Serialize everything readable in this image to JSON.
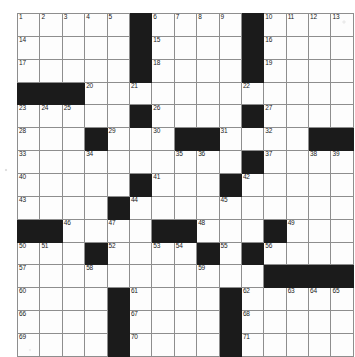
{
  "document": {
    "type": "crossword-puzzle",
    "title": "Crossword Puzzle Grid",
    "grid_size": {
      "rows": 15,
      "cols": 15
    },
    "colors": {
      "block": "#1b1b1b",
      "cell": "#fdfdfd",
      "grid_line": "#8e8e8e",
      "outer_border": "#4a4a4a",
      "number_text": "#1a1a1a"
    },
    "highest_clue_number": 71,
    "grid": [
      [
        {
          "n": "1"
        },
        {
          "n": "2"
        },
        {
          "n": "3"
        },
        {
          "n": "4"
        },
        {
          "n": "5"
        },
        {
          "block": true
        },
        {
          "n": "6"
        },
        {
          "n": "7"
        },
        {
          "n": "8"
        },
        {
          "n": "9"
        },
        {
          "block": true
        },
        {
          "n": "10"
        },
        {
          "n": "11"
        },
        {
          "n": "12"
        },
        {
          "n": "13"
        }
      ],
      [
        {
          "n": "14"
        },
        {},
        {},
        {},
        {},
        {
          "block": true
        },
        {
          "n": "15"
        },
        {},
        {},
        {},
        {
          "block": true
        },
        {
          "n": "16"
        },
        {},
        {},
        {}
      ],
      [
        {
          "n": "17"
        },
        {},
        {},
        {},
        {},
        {
          "block": true
        },
        {
          "n": "18"
        },
        {},
        {},
        {},
        {
          "block": true
        },
        {
          "n": "19"
        },
        {},
        {},
        {}
      ],
      [
        {
          "block": true
        },
        {
          "block": true
        },
        {
          "block": true
        },
        {
          "n": "20"
        },
        {},
        {
          "n": "21"
        },
        {},
        {},
        {},
        {},
        {
          "n": "22"
        },
        {},
        {},
        {},
        {}
      ],
      [
        {
          "n": "23"
        },
        {
          "n": "24"
        },
        {
          "n": "25"
        },
        {},
        {},
        {
          "block": true
        },
        {
          "n": "26"
        },
        {},
        {},
        {},
        {
          "block": true
        },
        {
          "n": "27"
        },
        {},
        {},
        {}
      ],
      [
        {
          "n": "28"
        },
        {},
        {},
        {
          "block": true
        },
        {
          "n": "29"
        },
        {},
        {
          "n": "30"
        },
        {
          "block": true
        },
        {
          "block": true
        },
        {
          "n": "31"
        },
        {},
        {
          "n": "32"
        },
        {},
        {
          "block": true
        },
        {
          "block": true
        }
      ],
      [
        {
          "n": "33"
        },
        {},
        {},
        {
          "n": "34"
        },
        {},
        {},
        {},
        {
          "n": "35"
        },
        {
          "n": "36"
        },
        {},
        {
          "block": true
        },
        {
          "n": "37"
        },
        {},
        {
          "n": "38"
        },
        {
          "n": "39"
        }
      ],
      [
        {
          "n": "40"
        },
        {},
        {},
        {},
        {},
        {
          "block": true
        },
        {
          "n": "41"
        },
        {},
        {},
        {
          "block": true
        },
        {
          "n": "42"
        },
        {},
        {},
        {},
        {}
      ],
      [
        {
          "n": "43"
        },
        {},
        {},
        {},
        {
          "block": true
        },
        {
          "n": "44"
        },
        {},
        {},
        {},
        {
          "n": "45"
        },
        {},
        {},
        {},
        {},
        {}
      ],
      [
        {
          "block": true
        },
        {
          "block": true
        },
        {
          "n": "46"
        },
        {},
        {
          "n": "47"
        },
        {},
        {
          "block": true
        },
        {
          "block": true
        },
        {
          "n": "48"
        },
        {},
        {},
        {
          "block": true
        },
        {
          "n": "49"
        },
        {},
        {}
      ],
      [
        {
          "n": "50"
        },
        {
          "n": "51"
        },
        {},
        {
          "block": true
        },
        {
          "n": "52"
        },
        {},
        {
          "n": "53"
        },
        {
          "n": "54"
        },
        {
          "block": true
        },
        {
          "n": "55"
        },
        {
          "block": true
        },
        {
          "n": "56"
        },
        {},
        {},
        {}
      ],
      [
        {
          "n": "57"
        },
        {},
        {},
        {
          "n": "58"
        },
        {},
        {},
        {},
        {},
        {
          "n": "59"
        },
        {},
        {},
        {
          "block": true
        },
        {
          "block": true
        },
        {
          "block": true
        },
        {
          "block": true
        }
      ],
      [
        {
          "n": "60"
        },
        {},
        {},
        {},
        {
          "block": true
        },
        {
          "n": "61"
        },
        {},
        {},
        {},
        {
          "block": true
        },
        {
          "n": "62"
        },
        {},
        {
          "n": "63"
        },
        {
          "n": "64"
        },
        {
          "n": "65"
        }
      ],
      [
        {
          "n": "66"
        },
        {},
        {},
        {},
        {
          "block": true
        },
        {
          "n": "67"
        },
        {},
        {},
        {},
        {
          "block": true
        },
        {
          "n": "68"
        },
        {},
        {},
        {},
        {}
      ],
      [
        {
          "n": "69"
        },
        {},
        {},
        {},
        {
          "block": true
        },
        {
          "n": "70"
        },
        {},
        {},
        {},
        {
          "block": true
        },
        {
          "n": "71"
        },
        {},
        {},
        {},
        {}
      ]
    ]
  }
}
